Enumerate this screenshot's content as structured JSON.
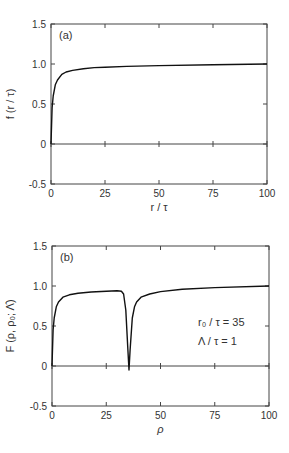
{
  "chart_data": [
    {
      "type": "line",
      "panel_label": "(a)",
      "xlabel": "r / τ",
      "ylabel": "f (r / τ)",
      "xlim": [
        0,
        100
      ],
      "ylim": [
        -0.5,
        1.5
      ],
      "xticks": [
        "0",
        "25",
        "50",
        "75",
        "100"
      ],
      "yticks": [
        "1.5",
        "1.0",
        "0.5",
        "0",
        "-0.5"
      ],
      "grid": false,
      "zero_line": true,
      "series": [
        {
          "name": "f(r/τ)",
          "x": [
            0,
            0.5,
            1,
            2,
            3,
            5,
            7,
            10,
            15,
            20,
            25,
            35,
            50,
            75,
            100
          ],
          "y": [
            0,
            0.45,
            0.6,
            0.74,
            0.8,
            0.87,
            0.9,
            0.92,
            0.94,
            0.955,
            0.96,
            0.97,
            0.98,
            0.99,
            1.0
          ]
        }
      ]
    },
    {
      "type": "line",
      "panel_label": "(b)",
      "xlabel": "ρ",
      "ylabel": "F (ρ, ρ₀; Λ̂)",
      "xlim": [
        0,
        100
      ],
      "ylim": [
        -0.5,
        1.5
      ],
      "xticks": [
        "0",
        "25",
        "50",
        "75",
        "100"
      ],
      "yticks": [
        "1.5",
        "1.0",
        "0.5",
        "0",
        "-0.5"
      ],
      "grid": false,
      "zero_line": true,
      "annotations": [
        "r₀ / τ = 35",
        "Λ / τ = 1"
      ],
      "series": [
        {
          "name": "F(ρ,ρ₀;Λ̂)",
          "x": [
            0,
            0.5,
            1,
            2,
            3,
            5,
            8,
            12,
            18,
            25,
            30,
            32,
            33,
            34,
            35,
            35.5,
            36,
            37,
            38,
            39,
            41,
            45,
            50,
            60,
            75,
            100
          ],
          "y": [
            0,
            0.45,
            0.6,
            0.74,
            0.8,
            0.86,
            0.89,
            0.91,
            0.925,
            0.935,
            0.94,
            0.935,
            0.9,
            0.7,
            0.2,
            -0.05,
            0.2,
            0.6,
            0.74,
            0.8,
            0.86,
            0.9,
            0.93,
            0.96,
            0.98,
            1.0
          ]
        }
      ]
    }
  ]
}
